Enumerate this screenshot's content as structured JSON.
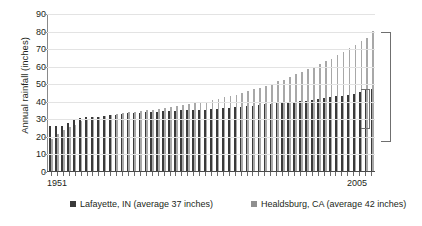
{
  "chart_data": {
    "type": "bar",
    "title": "",
    "xlabel": "",
    "ylabel": "Annual rainfall (inches)",
    "ylim": [
      0,
      90
    ],
    "yticks": [
      0,
      10,
      20,
      30,
      40,
      50,
      60,
      70,
      80,
      90
    ],
    "grid": true,
    "legend_position": "bottom",
    "x_axis_labels": {
      "left": "1951",
      "right": "2005"
    },
    "note": "Years 1951-2005 sorted ascending by rainfall; paired bars per rank",
    "categories": [
      "1951",
      "1952",
      "1953",
      "1954",
      "1955",
      "1956",
      "1957",
      "1958",
      "1959",
      "1960",
      "1961",
      "1962",
      "1963",
      "1964",
      "1965",
      "1966",
      "1967",
      "1968",
      "1969",
      "1970",
      "1971",
      "1972",
      "1973",
      "1974",
      "1975",
      "1976",
      "1977",
      "1978",
      "1979",
      "1980",
      "1981",
      "1982",
      "1983",
      "1984",
      "1985",
      "1986",
      "1987",
      "1988",
      "1989",
      "1990",
      "1991",
      "1992",
      "1993",
      "1994",
      "1995",
      "1996",
      "1997",
      "1998",
      "1999",
      "2000",
      "2001",
      "2002",
      "2003",
      "2004",
      "2005"
    ],
    "series": [
      {
        "name": "Lafayette, IN (average 37 inches)",
        "color": "#3a3a3a",
        "average": 37,
        "values": [
          25.5,
          25.5,
          25.5,
          27.5,
          29.0,
          30.0,
          30.5,
          31.0,
          31.0,
          31.5,
          32.0,
          32.0,
          32.5,
          33.0,
          33.0,
          33.0,
          33.5,
          33.5,
          33.5,
          34.0,
          34.0,
          34.0,
          34.5,
          34.5,
          34.5,
          35.0,
          35.0,
          35.5,
          35.5,
          36.0,
          36.0,
          36.5,
          36.5,
          37.0,
          37.0,
          37.5,
          38.0,
          38.0,
          38.5,
          39.0,
          39.0,
          39.5,
          40.0,
          40.0,
          40.5,
          41.0,
          41.5,
          42.0,
          42.5,
          43.0,
          43.5,
          44.0,
          45.0,
          46.0,
          47.0
        ]
      },
      {
        "name": "Healdsburg, CA (average 42 inches)",
        "color": "#a8a8a8",
        "average": 42,
        "values": [
          18.0,
          21.0,
          23.5,
          25.0,
          26.0,
          28.5,
          29.5,
          30.5,
          31.0,
          31.5,
          32.0,
          32.5,
          33.0,
          33.5,
          33.5,
          34.0,
          34.5,
          35.0,
          35.5,
          36.0,
          36.5,
          37.0,
          37.5,
          38.0,
          38.5,
          39.0,
          39.5,
          40.5,
          41.0,
          42.0,
          42.5,
          43.5,
          44.5,
          45.5,
          46.5,
          47.5,
          48.5,
          49.5,
          51.0,
          52.0,
          53.5,
          55.0,
          56.5,
          58.0,
          59.5,
          61.0,
          62.5,
          64.0,
          66.0,
          68.0,
          70.0,
          72.0,
          74.0,
          76.0,
          80.0
        ]
      }
    ],
    "annotations": [
      {
        "name": "healdsburg-range-bracket",
        "label": "",
        "y_top": 80,
        "y_bottom": 18
      },
      {
        "name": "lafayette-range-bracket",
        "label": "",
        "y_top": 47,
        "y_bottom": 25.5
      }
    ]
  }
}
